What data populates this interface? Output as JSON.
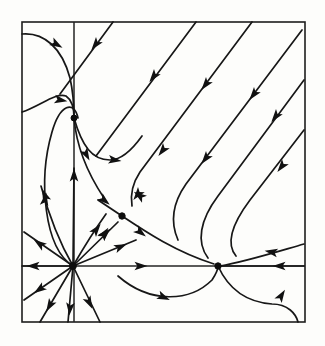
{
  "figure": {
    "kind": "phase-portrait",
    "title": "",
    "background_color": "#fdfdfb",
    "line_color": "#171717",
    "axis_color": "#232323",
    "frame_color": "#1d1d1d"
  },
  "chart_data": {
    "type": "scatter",
    "title": "",
    "xlabel": "",
    "ylabel": "",
    "grid": false,
    "legend": "none",
    "xlim": [
      22,
      305
    ],
    "ylim": [
      322,
      22
    ],
    "frame": {
      "x": 22,
      "y": 22,
      "width": 283,
      "height": 300
    },
    "axes": {
      "x_axis_y": 266,
      "y_axis_x": 74,
      "x_axis": {
        "x1": 22,
        "y1": 266,
        "x2": 305,
        "y2": 266
      },
      "y_axis": {
        "x1": 74,
        "y1": 22,
        "x2": 74,
        "y2": 322
      }
    },
    "fixed_points": [
      {
        "name": "star-node-source",
        "x": 73,
        "y": 266,
        "radius": 3.4
      },
      {
        "name": "saddle-upper",
        "x": 74,
        "y": 118,
        "radius": 3.0
      },
      {
        "name": "saddle-center",
        "x": 122,
        "y": 216,
        "radius": 3.2
      },
      {
        "name": "node-right",
        "x": 218,
        "y": 266,
        "radius": 3.2
      }
    ],
    "trajectories": [
      {
        "name": "star-ray-up",
        "d": "M 73,266 L 74,168"
      },
      {
        "name": "star-ray-upleft1",
        "d": "M 73,266 C 58,240 48,212 41,186"
      },
      {
        "name": "star-ray-upleft2",
        "d": "M 73,266 L 24,232"
      },
      {
        "name": "star-ray-left",
        "d": "M 73,266 L 22,266"
      },
      {
        "name": "star-ray-downleft1",
        "d": "M 73,266 L 24,300"
      },
      {
        "name": "star-ray-downleft2",
        "d": "M 73,266 L 40,322"
      },
      {
        "name": "star-ray-down",
        "d": "M 73,266 L 68,322"
      },
      {
        "name": "star-ray-downright",
        "d": "M 73,266 L 100,322"
      },
      {
        "name": "star-ray-right1",
        "d": "M 73,266 L 136,240"
      },
      {
        "name": "star-ray-upright1",
        "d": "M 73,266 L 118,222"
      },
      {
        "name": "star-ray-upright2",
        "d": "M 73,266 C 88,240 96,228 106,214"
      },
      {
        "name": "left-loop-inner",
        "d": "M 73,266 C 44,248 38,180 52,132 C 60,104 74,100 78,118"
      },
      {
        "name": "left-arc-outer",
        "d": "M 22,34 C 44,32 62,48 70,78 C 74,96 74,110 74,118"
      },
      {
        "name": "left-arc-mid",
        "d": "M 22,112 C 40,106 56,92 66,96 C 72,100 74,110 74,118"
      },
      {
        "name": "saddle-out-down",
        "d": "M 74,118 C 76,142 84,168 104,198"
      },
      {
        "name": "saddle-out-curve",
        "d": "M 74,118 C 82,146 92,160 110,160 C 122,160 132,150 142,136"
      },
      {
        "name": "diag-line-1",
        "d": "M 113,22 L 60,94"
      },
      {
        "name": "diag-line-2",
        "d": "M 196,22 L 96,156"
      },
      {
        "name": "diag-line-3",
        "d": "M 252,22 L 140,172 C 132,184 130,194 132,206"
      },
      {
        "name": "diag-line-4",
        "d": "M 302,30 L 186,184 C 172,204 170,222 178,240"
      },
      {
        "name": "diag-line-5",
        "d": "M 304,80 L 218,196 C 200,220 196,242 208,258"
      },
      {
        "name": "diag-line-6",
        "d": "M 304,130 L 250,200 C 232,224 226,244 236,256"
      },
      {
        "name": "into-node-right-hi",
        "d": "M 304,244 C 276,252 244,262 220,266"
      },
      {
        "name": "into-node-right-ax",
        "d": "M 304,266 L 222,266"
      },
      {
        "name": "node-right-lower",
        "d": "M 218,266 C 228,288 244,302 272,304 C 288,304 296,314 298,322"
      },
      {
        "name": "bottom-loop",
        "d": "M 118,276 C 150,304 190,302 212,280 C 216,274 218,270 218,266"
      },
      {
        "name": "saddle-center-out-r",
        "d": "M 122,216 C 146,232 176,252 214,264"
      },
      {
        "name": "saddle-center-out-l",
        "d": "M 122,216 L 98,200"
      }
    ],
    "arrows": [
      {
        "name": "arrow-star-up",
        "x": 74,
        "y": 176,
        "angle": -90
      },
      {
        "name": "arrow-star-upleft1",
        "x": 45,
        "y": 196,
        "angle": -112
      },
      {
        "name": "arrow-star-upleft2",
        "x": 40,
        "y": 244,
        "angle": -145
      },
      {
        "name": "arrow-star-left",
        "x": 34,
        "y": 266,
        "angle": 180
      },
      {
        "name": "arrow-star-downleft1",
        "x": 40,
        "y": 289,
        "angle": 145
      },
      {
        "name": "arrow-star-downleft2",
        "x": 50,
        "y": 305,
        "angle": 120
      },
      {
        "name": "arrow-star-down",
        "x": 70,
        "y": 308,
        "angle": 95
      },
      {
        "name": "arrow-star-downright",
        "x": 89,
        "y": 302,
        "angle": 64
      },
      {
        "name": "arrow-star-right1",
        "x": 120,
        "y": 247,
        "angle": -23
      },
      {
        "name": "arrow-star-upright1",
        "x": 105,
        "y": 234,
        "angle": -45
      },
      {
        "name": "arrow-star-upright2",
        "x": 96,
        "y": 230,
        "angle": -52
      },
      {
        "name": "arrow-leftloop-down",
        "x": 45,
        "y": 200,
        "angle": -80
      },
      {
        "name": "arrow-leftarc-outer",
        "x": 56,
        "y": 44,
        "angle": 30
      },
      {
        "name": "arrow-leftarc-mid",
        "x": 60,
        "y": 100,
        "angle": 10
      },
      {
        "name": "arrow-saddle-down",
        "x": 86,
        "y": 154,
        "angle": 62
      },
      {
        "name": "arrow-saddle-curve",
        "x": 114,
        "y": 160,
        "angle": 8
      },
      {
        "name": "arrow-diag1",
        "x": 96,
        "y": 44,
        "angle": 128
      },
      {
        "name": "arrow-diag2",
        "x": 154,
        "y": 76,
        "angle": 128
      },
      {
        "name": "arrow-diag3",
        "x": 206,
        "y": 84,
        "angle": 128
      },
      {
        "name": "arrow-diag3b",
        "x": 163,
        "y": 150,
        "angle": 128
      },
      {
        "name": "arrow-diag4",
        "x": 254,
        "y": 94,
        "angle": 128
      },
      {
        "name": "arrow-diag4b",
        "x": 206,
        "y": 158,
        "angle": 128
      },
      {
        "name": "arrow-diag5",
        "x": 276,
        "y": 116,
        "angle": 128
      },
      {
        "name": "arrow-diag5b",
        "x": 138,
        "y": 194,
        "angle": 128
      },
      {
        "name": "arrow-diag6",
        "x": 282,
        "y": 166,
        "angle": 128
      },
      {
        "name": "arrow-right-hi",
        "x": 272,
        "y": 252,
        "angle": 190
      },
      {
        "name": "arrow-right-axis",
        "x": 280,
        "y": 266,
        "angle": 180
      },
      {
        "name": "arrow-node-lower",
        "x": 281,
        "y": 296,
        "angle": -58
      },
      {
        "name": "arrow-bottom-loop",
        "x": 163,
        "y": 297,
        "angle": 24
      },
      {
        "name": "arrow-axis-right-mid",
        "x": 140,
        "y": 266,
        "angle": 0
      },
      {
        "name": "arrow-saddle-in-ne",
        "x": 140,
        "y": 196,
        "angle": 215
      },
      {
        "name": "arrow-saddle-in-sw",
        "x": 104,
        "y": 234,
        "angle": -55
      },
      {
        "name": "arrow-saddle-in-nw",
        "x": 104,
        "y": 200,
        "angle": 40
      },
      {
        "name": "arrow-saddle-out-se",
        "x": 140,
        "y": 232,
        "angle": 38
      }
    ]
  }
}
